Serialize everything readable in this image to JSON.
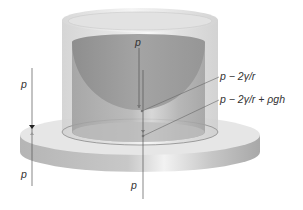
{
  "figure": {
    "labels": {
      "top_center": "p",
      "below_meniscus": "p − 2γ/r",
      "column_base": "p − 2γ/r + ρgh",
      "left_upper": "p",
      "left_lower": "p",
      "bottom_center": "p"
    },
    "colors": {
      "background": "#ffffff",
      "glass": "#d9d9d9",
      "liquid": "#a9a9a9",
      "plate_top": "#e4e4e4",
      "plate_side": "#b8b8b8",
      "lines": "#555555",
      "text": "#333333"
    }
  }
}
